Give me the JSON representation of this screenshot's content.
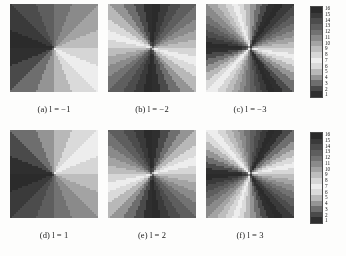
{
  "figure": {
    "panel_count": 6,
    "rows": 2,
    "cols": 3
  },
  "colorbar": {
    "levels": [
      16,
      15,
      14,
      13,
      12,
      11,
      10,
      9,
      8,
      7,
      6,
      5,
      4,
      3,
      2,
      1
    ],
    "min_label": "1",
    "max_label": "16",
    "orientation": "vertical",
    "colors": [
      "#2b2b2b",
      "#3a3a3a",
      "#4c4c4c",
      "#5e5e5e",
      "#727272",
      "#8a8a8a",
      "#a3a3a3",
      "#bdbdbd",
      "#d6d6d6",
      "#ededed",
      "#dadada",
      "#b8b8b8",
      "#949494",
      "#6e6e6e",
      "#4a4a4a",
      "#2f2f2f"
    ]
  },
  "chart_data": {
    "type": "heatmap",
    "title": "",
    "xlabel": "",
    "ylabel": "",
    "grid": false,
    "legend_position": "right",
    "colormap": "cyclic-gray-16",
    "levels": 16,
    "zlim": [
      1,
      16
    ],
    "panels": [
      {
        "key": "a",
        "label_prefix": "(a)",
        "variable": "l",
        "value": -1,
        "caption": "(a) l = −1",
        "topological_charge": -1,
        "sectors": 1,
        "handedness": "counterclockwise",
        "row": 0,
        "col": 0
      },
      {
        "key": "b",
        "label_prefix": "(b)",
        "variable": "l",
        "value": -2,
        "caption": "(b) l = −2",
        "topological_charge": -2,
        "sectors": 2,
        "handedness": "counterclockwise",
        "row": 0,
        "col": 1
      },
      {
        "key": "c",
        "label_prefix": "(c)",
        "variable": "l",
        "value": -3,
        "caption": "(c) l = −3",
        "topological_charge": -3,
        "sectors": 3,
        "handedness": "counterclockwise",
        "row": 0,
        "col": 2
      },
      {
        "key": "d",
        "label_prefix": "(d)",
        "variable": "l",
        "value": 1,
        "caption": "(d) l = 1",
        "topological_charge": 1,
        "sectors": 1,
        "handedness": "clockwise",
        "row": 1,
        "col": 0
      },
      {
        "key": "e",
        "label_prefix": "(e)",
        "variable": "l",
        "value": 2,
        "caption": "(e) l = 2",
        "topological_charge": 2,
        "sectors": 2,
        "handedness": "clockwise",
        "row": 1,
        "col": 1
      },
      {
        "key": "f",
        "label_prefix": "(f)",
        "variable": "l",
        "value": 3,
        "caption": "(f) l = 3",
        "topological_charge": 3,
        "sectors": 3,
        "handedness": "clockwise",
        "row": 1,
        "col": 2
      }
    ],
    "render": {
      "grid_n": 44,
      "phase_offset_deg": 180,
      "description": "Quantized spiral phase map, level = ceil(16 * frac((l*theta + offset)/2pi))"
    }
  }
}
